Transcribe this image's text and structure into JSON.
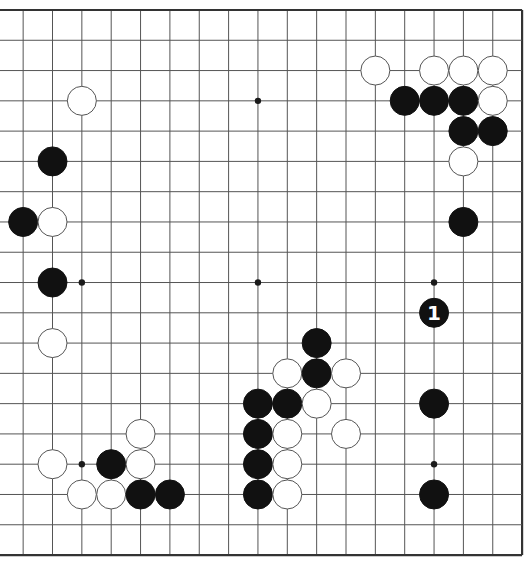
{
  "board": {
    "size": 19,
    "visible_columns": [
      2,
      19
    ],
    "visible_rows": [
      1,
      19
    ],
    "origin_x": -6.2,
    "origin_y": 10,
    "spacing_x": 29.35,
    "spacing_y": 30.28,
    "edges": {
      "top": true,
      "right": true,
      "bottom": true,
      "left": false
    },
    "stone_radius": 14.5,
    "colors": {
      "line": "#555555",
      "edge": "#333333",
      "black": "#111111",
      "white": "#ffffff",
      "background": "#ffffff"
    }
  },
  "star_points": [
    {
      "col": 4,
      "row": 4
    },
    {
      "col": 10,
      "row": 4
    },
    {
      "col": 16,
      "row": 4
    },
    {
      "col": 4,
      "row": 10
    },
    {
      "col": 10,
      "row": 10
    },
    {
      "col": 16,
      "row": 10
    },
    {
      "col": 4,
      "row": 16
    },
    {
      "col": 10,
      "row": 16
    },
    {
      "col": 16,
      "row": 16
    }
  ],
  "stones": [
    {
      "color": "white",
      "col": 14,
      "row": 3
    },
    {
      "color": "white",
      "col": 16,
      "row": 3
    },
    {
      "color": "white",
      "col": 17,
      "row": 3
    },
    {
      "color": "white",
      "col": 18,
      "row": 3
    },
    {
      "color": "black",
      "col": 15,
      "row": 4
    },
    {
      "color": "black",
      "col": 16,
      "row": 4
    },
    {
      "color": "black",
      "col": 17,
      "row": 4
    },
    {
      "color": "white",
      "col": 18,
      "row": 4
    },
    {
      "color": "black",
      "col": 17,
      "row": 5
    },
    {
      "color": "black",
      "col": 18,
      "row": 5
    },
    {
      "color": "white",
      "col": 17,
      "row": 6
    },
    {
      "color": "black",
      "col": 17,
      "row": 8
    },
    {
      "color": "white",
      "col": 4,
      "row": 4
    },
    {
      "color": "black",
      "col": 3,
      "row": 6
    },
    {
      "color": "black",
      "col": 2,
      "row": 8
    },
    {
      "color": "white",
      "col": 3,
      "row": 8
    },
    {
      "color": "black",
      "col": 3,
      "row": 10
    },
    {
      "color": "white",
      "col": 3,
      "row": 12
    },
    {
      "color": "white",
      "col": 6,
      "row": 15
    },
    {
      "color": "white",
      "col": 3,
      "row": 16
    },
    {
      "color": "black",
      "col": 5,
      "row": 16
    },
    {
      "color": "white",
      "col": 6,
      "row": 16
    },
    {
      "color": "white",
      "col": 4,
      "row": 17
    },
    {
      "color": "white",
      "col": 5,
      "row": 17
    },
    {
      "color": "black",
      "col": 6,
      "row": 17
    },
    {
      "color": "black",
      "col": 7,
      "row": 17
    },
    {
      "color": "black",
      "col": 12,
      "row": 12
    },
    {
      "color": "white",
      "col": 11,
      "row": 13
    },
    {
      "color": "black",
      "col": 12,
      "row": 13
    },
    {
      "color": "white",
      "col": 13,
      "row": 13
    },
    {
      "color": "black",
      "col": 10,
      "row": 14
    },
    {
      "color": "black",
      "col": 11,
      "row": 14
    },
    {
      "color": "white",
      "col": 12,
      "row": 14
    },
    {
      "color": "black",
      "col": 10,
      "row": 15
    },
    {
      "color": "white",
      "col": 11,
      "row": 15
    },
    {
      "color": "white",
      "col": 13,
      "row": 15
    },
    {
      "color": "black",
      "col": 10,
      "row": 16
    },
    {
      "color": "white",
      "col": 11,
      "row": 16
    },
    {
      "color": "black",
      "col": 10,
      "row": 17
    },
    {
      "color": "white",
      "col": 11,
      "row": 17
    },
    {
      "color": "black",
      "col": 16,
      "row": 11,
      "label": "1"
    },
    {
      "color": "black",
      "col": 16,
      "row": 14
    },
    {
      "color": "black",
      "col": 16,
      "row": 17
    }
  ],
  "caption": "Go board diagram — Black move 1"
}
